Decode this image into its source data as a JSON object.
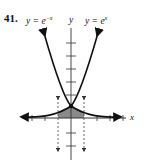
{
  "problem": {
    "number": "41."
  },
  "labels": {
    "left_curve_prefix": "y = e",
    "left_curve_exp": "−x",
    "right_curve_prefix": "y = e",
    "right_curve_exp": "x",
    "y_axis": "y",
    "x_axis": "x"
  },
  "colors": {
    "curve": "#111111",
    "axis": "#333333",
    "shade": "#8a8a8a",
    "dashed": "#555555"
  },
  "graph": {
    "curves": [
      "y = e^-x",
      "y = e^x"
    ],
    "intersection": [
      0,
      1
    ],
    "shaded_region": "between y = e^-x and y = e^x from x = -1 to x = 1 below curves",
    "dashed_lines": [
      "x = -1",
      "x = 1"
    ],
    "x_ticks": [
      -3,
      -2,
      -1,
      1,
      2,
      3
    ],
    "y_ticks": [
      -2,
      -1,
      1,
      2,
      3,
      4,
      5,
      6
    ]
  }
}
